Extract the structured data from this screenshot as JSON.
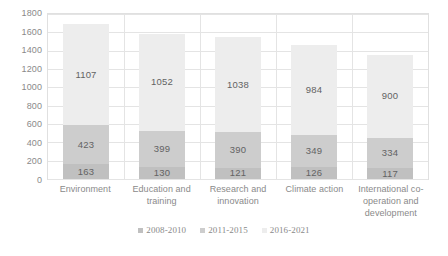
{
  "chart_data": {
    "type": "bar",
    "subtype": "stacked-bar",
    "title": "",
    "xlabel": "",
    "ylabel": "",
    "ylim": [
      0,
      1800
    ],
    "ytick_step": 200,
    "yticks": [
      1800,
      1600,
      1400,
      1200,
      1000,
      800,
      600,
      400,
      200,
      0
    ],
    "grid": true,
    "grid_orientation": "both",
    "legend_position": "bottom",
    "categories": [
      "Environment",
      "Education and training",
      "Research and innovation",
      "Climate action",
      "International co-operation and development"
    ],
    "series": [
      {
        "name": "2008-2010",
        "color": "#c0c0c0",
        "values": [
          163,
          130,
          121,
          126,
          117
        ]
      },
      {
        "name": "2011-2015",
        "color": "#cdcdcd",
        "values": [
          423,
          399,
          390,
          349,
          334
        ]
      },
      {
        "name": "2016-2021",
        "color": "#ededed",
        "values": [
          1107,
          1052,
          1038,
          984,
          900
        ]
      }
    ],
    "totals": [
      1693,
      1581,
      1549,
      1459,
      1351
    ]
  },
  "colors": {
    "background": "#ffffff",
    "gridline": "#e4e4e4",
    "plot_border": "#e0e0e0",
    "tick_text": "#8a8a8a",
    "bar_label_text": "#636363"
  }
}
